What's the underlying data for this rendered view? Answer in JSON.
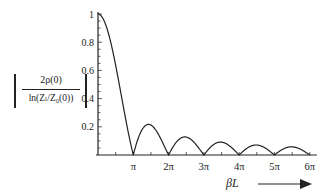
{
  "chart_data": {
    "type": "line",
    "title": "",
    "xlabel": "βL",
    "ylabel": "|2ρ(0) / ln(Z_l/Z_0(0))|",
    "ylabel_numerator": "2ρ(0)",
    "ylabel_denominator": "ln(Zₗ/Z₀(0))",
    "xlim": [
      0,
      6.2
    ],
    "ylim": [
      0,
      1
    ],
    "x_unit": "π",
    "x_ticks": [
      1,
      2,
      3,
      4,
      5,
      6
    ],
    "x_tick_labels": [
      "π",
      "2π",
      "3π",
      "4π",
      "5π",
      "6π"
    ],
    "y_ticks": [
      0.2,
      0.4,
      0.6,
      0.8,
      1
    ],
    "y_tick_labels": [
      "0.2",
      "0.4",
      "0.6",
      "0.8",
      "1"
    ],
    "grid": false,
    "legend": null,
    "series": [
      {
        "name": "|sin(βL)/βL|",
        "x_in_pi": [
          0,
          0.25,
          0.5,
          0.75,
          1,
          1.25,
          1.43,
          1.75,
          2,
          2.25,
          2.46,
          2.75,
          3,
          3.25,
          3.47,
          3.75,
          4,
          4.25,
          4.48,
          4.75,
          5,
          5.25,
          5.48,
          5.75,
          6
        ],
        "values": [
          1,
          0.9,
          0.64,
          0.3,
          0,
          0.18,
          0.217,
          0.13,
          0,
          0.1,
          0.128,
          0.08,
          0,
          0.07,
          0.091,
          0.06,
          0,
          0.053,
          0.071,
          0.047,
          0,
          0.043,
          0.058,
          0.039,
          0
        ]
      }
    ],
    "annotations": [
      "arrow pointing right next to βL"
    ]
  }
}
